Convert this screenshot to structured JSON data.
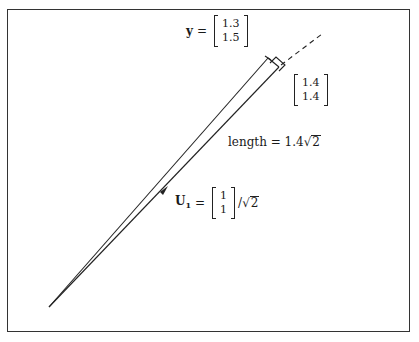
{
  "diagram": {
    "type": "vector-projection",
    "y_label": {
      "symbol": "y",
      "equals": "=",
      "vector": [
        "1.3",
        "1.5"
      ]
    },
    "projection_label": {
      "vector": [
        "1.4",
        "1.4"
      ]
    },
    "length_label": {
      "text": "length = 1.4",
      "sqrt_arg": "2",
      "sqrt_symbol": "√"
    },
    "u1_label": {
      "symbol": "U",
      "subscript": "1",
      "equals": "=",
      "vector": [
        "1",
        "1"
      ],
      "divider": "/",
      "sqrt_symbol": "√",
      "sqrt_arg": "2"
    },
    "geometry": {
      "origin": [
        49,
        307
      ],
      "y_end": [
        268,
        58
      ],
      "projection_end": [
        279,
        67
      ],
      "dashed_end": [
        322,
        35
      ],
      "arrow_at": [
        165,
        190
      ]
    },
    "colors": {
      "line": "#222222",
      "frame": "#333333",
      "background": "#ffffff"
    }
  }
}
